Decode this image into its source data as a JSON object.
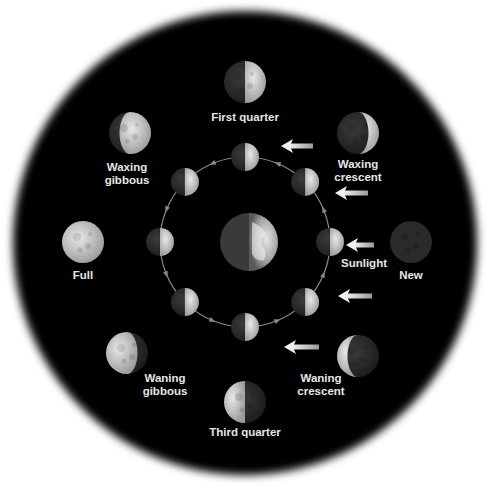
{
  "diagram": {
    "colors": {
      "background": "#000000",
      "page": "#ffffff",
      "label": "#e6e6e6",
      "orbit": "#8a8a8a",
      "lit": "#d9d9d9",
      "dark": "#2e2e2e",
      "arrow": "#dcdcdc"
    },
    "center_body": {
      "name": "Earth"
    },
    "sunlight_label": "Sunlight",
    "sunlight_arrows": 5,
    "orbit_direction": "counterclockwise",
    "phases": [
      {
        "id": "new",
        "lines": [
          "New"
        ],
        "lit_fraction": 0.0,
        "lit_side": "none"
      },
      {
        "id": "waxing-crescent",
        "lines": [
          "Waxing",
          "crescent"
        ],
        "lit_fraction": 0.25,
        "lit_side": "right"
      },
      {
        "id": "first-quarter",
        "lines": [
          "First quarter"
        ],
        "lit_fraction": 0.5,
        "lit_side": "right"
      },
      {
        "id": "waxing-gibbous",
        "lines": [
          "Waxing",
          "gibbous"
        ],
        "lit_fraction": 0.75,
        "lit_side": "right"
      },
      {
        "id": "full",
        "lines": [
          "Full"
        ],
        "lit_fraction": 1.0,
        "lit_side": "all"
      },
      {
        "id": "waning-gibbous",
        "lines": [
          "Waning",
          "gibbous"
        ],
        "lit_fraction": 0.75,
        "lit_side": "left"
      },
      {
        "id": "third-quarter",
        "lines": [
          "Third quarter"
        ],
        "lit_fraction": 0.5,
        "lit_side": "left"
      },
      {
        "id": "waning-crescent",
        "lines": [
          "Waning",
          "crescent"
        ],
        "lit_fraction": 0.25,
        "lit_side": "left"
      }
    ]
  }
}
